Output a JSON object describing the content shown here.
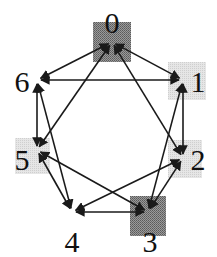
{
  "diagram": {
    "type": "directed-graph",
    "edge_style": "bidirectional",
    "colors": {
      "edge": "#1a1a1a",
      "dark_fill": "#8a8a8a",
      "light_fill": "#dcdcdc"
    },
    "nodes": [
      {
        "id": "0",
        "label": "0",
        "shade": "dark",
        "x": 112,
        "y": 42,
        "lx": 112,
        "ly": 33,
        "box": [
          93,
          22,
          38,
          40
        ]
      },
      {
        "id": "1",
        "label": "1",
        "shade": "light",
        "x": 183,
        "y": 80,
        "lx": 198,
        "ly": 92,
        "box": [
          168,
          62,
          38,
          38
        ]
      },
      {
        "id": "2",
        "label": "2",
        "shade": "light",
        "x": 183,
        "y": 158,
        "lx": 198,
        "ly": 170,
        "box": [
          168,
          140,
          34,
          38
        ]
      },
      {
        "id": "3",
        "label": "3",
        "shade": "dark",
        "x": 148,
        "y": 212,
        "lx": 150,
        "ly": 252,
        "box": [
          130,
          196,
          36,
          40
        ]
      },
      {
        "id": "4",
        "label": "4",
        "shade": "none",
        "x": 72,
        "y": 212,
        "lx": 72,
        "ly": 252,
        "box": null
      },
      {
        "id": "5",
        "label": "5",
        "shade": "light",
        "x": 37,
        "y": 150,
        "lx": 22,
        "ly": 170,
        "box": [
          15,
          138,
          35,
          36
        ]
      },
      {
        "id": "6",
        "label": "6",
        "shade": "none",
        "x": 37,
        "y": 80,
        "lx": 22,
        "ly": 92,
        "box": null
      }
    ],
    "edges": [
      {
        "from": "0",
        "to": "6"
      },
      {
        "from": "0",
        "to": "1"
      },
      {
        "from": "0",
        "to": "5"
      },
      {
        "from": "0",
        "to": "2"
      },
      {
        "from": "6",
        "to": "1"
      },
      {
        "from": "6",
        "to": "5"
      },
      {
        "from": "6",
        "to": "4"
      },
      {
        "from": "1",
        "to": "2"
      },
      {
        "from": "1",
        "to": "3"
      },
      {
        "from": "2",
        "to": "3"
      },
      {
        "from": "2",
        "to": "4"
      },
      {
        "from": "5",
        "to": "4"
      },
      {
        "from": "5",
        "to": "3"
      },
      {
        "from": "4",
        "to": "3"
      }
    ]
  }
}
